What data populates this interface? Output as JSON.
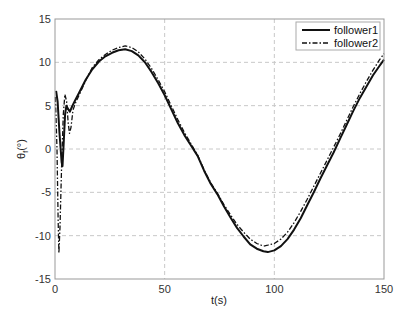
{
  "chart_data": {
    "type": "line",
    "title": "",
    "xlabel": "t(s)",
    "ylabel": "θ_f(°)",
    "ylabel_main": "θ",
    "ylabel_sub": "f",
    "ylabel_unit": "(°)",
    "xlim": [
      0,
      150
    ],
    "ylim": [
      -15,
      15
    ],
    "xticks": [
      0,
      50,
      100,
      150
    ],
    "yticks": [
      -15,
      -10,
      -5,
      0,
      5,
      10,
      15
    ],
    "grid": true,
    "legend_position": "upper right",
    "series": [
      {
        "name": "follower1",
        "style": "solid",
        "points": [
          [
            0.5,
            6.7
          ],
          [
            1.2,
            5.5
          ],
          [
            2.0,
            2.0
          ],
          [
            3.0,
            -1.5
          ],
          [
            3.4,
            -2.0
          ],
          [
            3.9,
            0.5
          ],
          [
            4.6,
            4.0
          ],
          [
            5.2,
            5.0
          ],
          [
            6.0,
            4.6
          ],
          [
            6.8,
            4.3
          ],
          [
            7.8,
            4.9
          ],
          [
            9.0,
            5.5
          ],
          [
            11,
            6.5
          ],
          [
            14,
            8.0
          ],
          [
            17,
            9.2
          ],
          [
            20,
            10.1
          ],
          [
            23,
            10.7
          ],
          [
            26,
            11.1
          ],
          [
            29,
            11.4
          ],
          [
            32,
            11.5
          ],
          [
            35,
            11.3
          ],
          [
            38,
            10.8
          ],
          [
            41,
            10.0
          ],
          [
            44,
            8.9
          ],
          [
            47,
            7.6
          ],
          [
            50,
            6.2
          ],
          [
            53,
            4.6
          ],
          [
            56,
            3.0
          ],
          [
            59,
            1.6
          ],
          [
            62,
            0.4
          ],
          [
            65,
            -0.8
          ],
          [
            68,
            -2.5
          ],
          [
            71,
            -4.0
          ],
          [
            74,
            -5.2
          ],
          [
            77,
            -6.6
          ],
          [
            80,
            -7.9
          ],
          [
            83,
            -9.1
          ],
          [
            86,
            -10.1
          ],
          [
            89,
            -11.0
          ],
          [
            92,
            -11.5
          ],
          [
            95,
            -11.8
          ],
          [
            97,
            -11.9
          ],
          [
            100,
            -11.7
          ],
          [
            103,
            -11.2
          ],
          [
            106,
            -10.4
          ],
          [
            109,
            -9.3
          ],
          [
            112,
            -8.0
          ],
          [
            115,
            -6.5
          ],
          [
            118,
            -5.0
          ],
          [
            121,
            -3.4
          ],
          [
            124,
            -1.9
          ],
          [
            127,
            -0.4
          ],
          [
            130,
            1.2
          ],
          [
            133,
            2.8
          ],
          [
            136,
            4.4
          ],
          [
            139,
            5.9
          ],
          [
            142,
            7.2
          ],
          [
            145,
            8.5
          ],
          [
            148,
            9.6
          ],
          [
            150,
            10.3
          ]
        ]
      },
      {
        "name": "follower2",
        "style": "dashdot",
        "points": [
          [
            0.2,
            6.0
          ],
          [
            0.9,
            0.0
          ],
          [
            1.4,
            -8.0
          ],
          [
            1.8,
            -12.0
          ],
          [
            2.3,
            -9.0
          ],
          [
            3.0,
            -2.0
          ],
          [
            3.8,
            4.0
          ],
          [
            4.5,
            6.3
          ],
          [
            5.3,
            5.5
          ],
          [
            6.0,
            3.0
          ],
          [
            6.6,
            1.8
          ],
          [
            7.3,
            2.5
          ],
          [
            8.2,
            4.5
          ],
          [
            9.5,
            5.4
          ],
          [
            11,
            6.2
          ],
          [
            14,
            7.9
          ],
          [
            17,
            9.4
          ],
          [
            20,
            10.3
          ],
          [
            23,
            10.9
          ],
          [
            26,
            11.4
          ],
          [
            29,
            11.7
          ],
          [
            32,
            11.9
          ],
          [
            35,
            11.7
          ],
          [
            38,
            11.2
          ],
          [
            41,
            10.4
          ],
          [
            44,
            9.3
          ],
          [
            47,
            8.0
          ],
          [
            50,
            6.6
          ],
          [
            53,
            5.0
          ],
          [
            56,
            3.4
          ],
          [
            59,
            1.9
          ],
          [
            62,
            0.6
          ],
          [
            65,
            -0.7
          ],
          [
            68,
            -2.4
          ],
          [
            71,
            -3.9
          ],
          [
            74,
            -5.1
          ],
          [
            77,
            -6.4
          ],
          [
            80,
            -7.6
          ],
          [
            83,
            -8.7
          ],
          [
            86,
            -9.6
          ],
          [
            89,
            -10.4
          ],
          [
            92,
            -10.9
          ],
          [
            95,
            -11.2
          ],
          [
            97,
            -11.1
          ],
          [
            100,
            -10.9
          ],
          [
            103,
            -10.4
          ],
          [
            106,
            -9.6
          ],
          [
            109,
            -8.5
          ],
          [
            112,
            -7.2
          ],
          [
            115,
            -5.8
          ],
          [
            118,
            -4.3
          ],
          [
            121,
            -2.8
          ],
          [
            124,
            -1.3
          ],
          [
            127,
            0.2
          ],
          [
            130,
            1.7
          ],
          [
            133,
            3.3
          ],
          [
            136,
            4.9
          ],
          [
            139,
            6.4
          ],
          [
            142,
            7.8
          ],
          [
            145,
            9.1
          ],
          [
            148,
            10.3
          ],
          [
            150,
            11.0
          ]
        ]
      }
    ]
  },
  "plot_area": {
    "left": 55,
    "right": 384,
    "top": 19,
    "bottom": 279
  },
  "colors": {
    "line": "#111111",
    "grid": "#c8c8c8",
    "axis": "#999999",
    "background": "#ffffff"
  }
}
